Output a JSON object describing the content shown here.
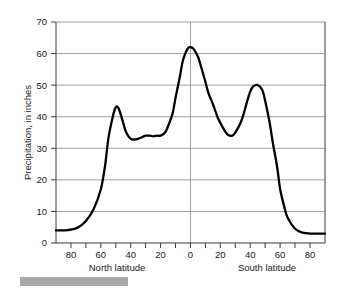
{
  "figure": {
    "caption_bar": {
      "label": "redacted-caption-bar",
      "color": "#a8a8a8"
    }
  },
  "chart_data": {
    "type": "line",
    "title": "",
    "subtitle": "",
    "xlabel": "",
    "ylabel": "Precipitation, in inches",
    "x_axis_left_label": "North latitude",
    "x_axis_right_label": "South latitude",
    "xlim": [
      90,
      -90
    ],
    "ylim": [
      0,
      70
    ],
    "grid": true,
    "legend": null,
    "y_ticks": [
      0,
      10,
      20,
      30,
      40,
      50,
      60,
      70
    ],
    "y_tick_labels": [
      "0",
      "10",
      "20",
      "30",
      "40",
      "50",
      "60",
      "70"
    ],
    "x_ticks": [
      80,
      70,
      60,
      50,
      40,
      30,
      20,
      10,
      0,
      -10,
      -20,
      -30,
      -40,
      -50,
      -60,
      -70,
      -80
    ],
    "x_major_ticks": [
      80,
      60,
      40,
      20,
      0,
      -20,
      -40,
      -60,
      -80
    ],
    "x_tick_labels": [
      "80",
      "60",
      "40",
      "20",
      "0",
      "20",
      "40",
      "60",
      "80"
    ],
    "series": [
      {
        "name": "Mean annual precipitation by latitude",
        "color": "#000000",
        "x": [
          90,
          85,
          80,
          75,
          70,
          65,
          60,
          57,
          55,
          52,
          50,
          48,
          45,
          43,
          40,
          37,
          35,
          32,
          30,
          27,
          25,
          22,
          20,
          17,
          15,
          12,
          10,
          7,
          5,
          2,
          0,
          -2,
          -5,
          -7,
          -10,
          -12,
          -15,
          -18,
          -20,
          -23,
          -25,
          -28,
          -30,
          -33,
          -35,
          -38,
          -40,
          -42,
          -45,
          -48,
          -50,
          -53,
          -55,
          -58,
          -60,
          -63,
          -65,
          -70,
          -75,
          -80,
          -85,
          -90
        ],
        "y": [
          4,
          4,
          4.2,
          5,
          7,
          10.5,
          17,
          25,
          33,
          40,
          43,
          42.5,
          38,
          35,
          33,
          32.8,
          33,
          33.6,
          34,
          34,
          33.8,
          34,
          34,
          35,
          37,
          41,
          46,
          53,
          58,
          61.5,
          62,
          61.5,
          59,
          56,
          51,
          47.5,
          44,
          40,
          38,
          35.5,
          34.3,
          34,
          35,
          37.5,
          40,
          45,
          48,
          49.6,
          50,
          48.5,
          45,
          38,
          32,
          24,
          17,
          11,
          8,
          4.5,
          3.3,
          3,
          3,
          3
        ]
      }
    ],
    "annotations": [],
    "peaks": [
      {
        "label": "north-midlatitude-peak",
        "latitude": "50 N",
        "value": 43
      },
      {
        "label": "equatorial-peak",
        "latitude": "0",
        "value": 62
      },
      {
        "label": "south-midlatitude-peak",
        "latitude": "45 S",
        "value": 50
      }
    ],
    "troughs": [
      {
        "label": "north-subtropical-trough",
        "latitude": "38 N",
        "value": 32.8
      },
      {
        "label": "south-subtropical-trough",
        "latitude": "28 S",
        "value": 34
      }
    ]
  }
}
